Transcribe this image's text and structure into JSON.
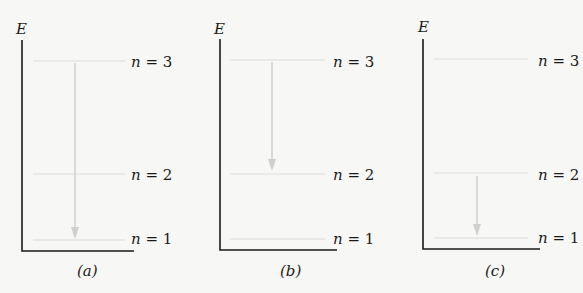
{
  "axis_label": "E",
  "colors": {
    "axis": "#1a1a1a",
    "level_line": "#e4e4e2",
    "arrow": "#cfcfcf",
    "background": "#f7f7f5"
  },
  "panels": [
    {
      "caption": "(a)",
      "levels": [
        {
          "label_var": "n",
          "label_eq": " = 3"
        },
        {
          "label_var": "n",
          "label_eq": " = 2"
        },
        {
          "label_var": "n",
          "label_eq": " = 1"
        }
      ],
      "transition": {
        "from": 3,
        "to": 1
      }
    },
    {
      "caption": "(b)",
      "levels": [
        {
          "label_var": "n",
          "label_eq": " = 3"
        },
        {
          "label_var": "n",
          "label_eq": " = 2"
        },
        {
          "label_var": "n",
          "label_eq": " = 1"
        }
      ],
      "transition": {
        "from": 3,
        "to": 2
      }
    },
    {
      "caption": "(c)",
      "levels": [
        {
          "label_var": "n",
          "label_eq": " = 3"
        },
        {
          "label_var": "n",
          "label_eq": " = 2"
        },
        {
          "label_var": "n",
          "label_eq": " = 1"
        }
      ],
      "transition": {
        "from": 2,
        "to": 1
      }
    }
  ]
}
